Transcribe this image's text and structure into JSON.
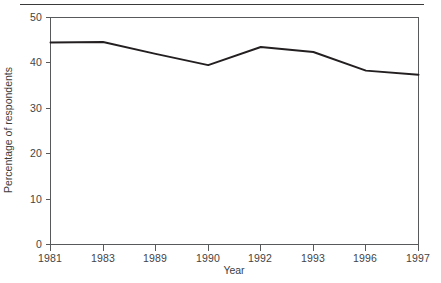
{
  "chart_data": {
    "type": "line",
    "title": "",
    "subtitle": "",
    "xlabel": "Year",
    "ylabel": "Percentage of respondents",
    "categories": [
      "1981",
      "1983",
      "1989",
      "1990",
      "1992",
      "1993",
      "1996",
      "1997"
    ],
    "values": [
      44.5,
      44.6,
      42.0,
      39.5,
      43.5,
      42.4,
      38.3,
      37.4
    ],
    "series": [
      {
        "name": "Percentage of respondents",
        "values": [
          44.5,
          44.6,
          42.0,
          39.5,
          43.5,
          42.4,
          38.3,
          37.4
        ]
      }
    ],
    "ylim": [
      0,
      50
    ],
    "yticks": [
      0,
      10,
      20,
      30,
      40,
      50
    ],
    "ytick_labels": [
      "0",
      "10",
      "20",
      "30",
      "40",
      "50"
    ],
    "xtick_labels": [
      "1981",
      "1983",
      "1989",
      "1990",
      "1992",
      "1993",
      "1996",
      "1997"
    ],
    "grid": false,
    "legend": false,
    "legend_position": "none",
    "line_color": "#231f20",
    "axis_color": "#58595b",
    "background_color": "#ffffff"
  },
  "decorations": {
    "top_rule": "horizontal-rule"
  }
}
